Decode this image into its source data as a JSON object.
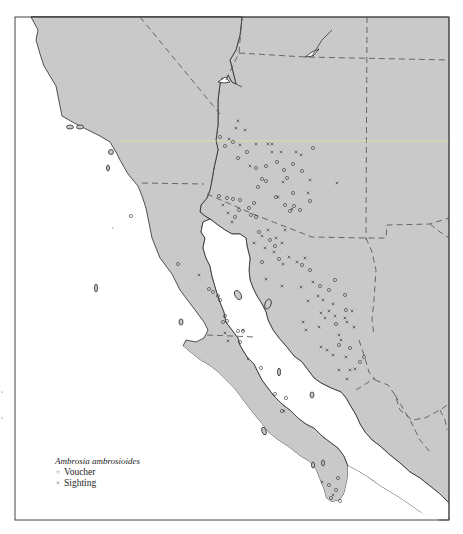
{
  "map": {
    "type": "species-distribution-map",
    "region": "Southwestern United States and Northwestern Mexico",
    "colors": {
      "land": "#c9c9c9",
      "water": "#ffffff",
      "coast": "#2a2a2a",
      "border": "#5a5a5a",
      "marker": "#333333"
    }
  },
  "legend": {
    "title": "Ambrosia ambrosioides",
    "items": [
      {
        "symbol": "circle",
        "glyph": "○",
        "label": "Voucher"
      },
      {
        "symbol": "cross",
        "glyph": "×",
        "label": "Sighting"
      }
    ]
  },
  "points": {
    "vouchers": [
      [
        131,
        216
      ],
      [
        178,
        264
      ],
      [
        220,
        137
      ],
      [
        225,
        146
      ],
      [
        233,
        142
      ],
      [
        238,
        158
      ],
      [
        247,
        152
      ],
      [
        256,
        168
      ],
      [
        266,
        166
      ],
      [
        277,
        162
      ],
      [
        284,
        170
      ],
      [
        293,
        164
      ],
      [
        302,
        171
      ],
      [
        287,
        178
      ],
      [
        262,
        179
      ],
      [
        258,
        187
      ],
      [
        313,
        148
      ],
      [
        266,
        181
      ],
      [
        219,
        196
      ],
      [
        227,
        198
      ],
      [
        233,
        199
      ],
      [
        240,
        200
      ],
      [
        249,
        208
      ],
      [
        254,
        203
      ],
      [
        235,
        217
      ],
      [
        251,
        215
      ],
      [
        285,
        205
      ],
      [
        290,
        211
      ],
      [
        294,
        206
      ],
      [
        300,
        210
      ],
      [
        310,
        201
      ],
      [
        239,
        210
      ],
      [
        256,
        217
      ],
      [
        293,
        193
      ],
      [
        276,
        197
      ],
      [
        259,
        232
      ],
      [
        270,
        240
      ],
      [
        275,
        246
      ],
      [
        279,
        259
      ],
      [
        262,
        262
      ],
      [
        302,
        265
      ],
      [
        310,
        270
      ],
      [
        320,
        286
      ],
      [
        329,
        290
      ],
      [
        335,
        280
      ],
      [
        345,
        295
      ],
      [
        336,
        324
      ],
      [
        346,
        310
      ],
      [
        339,
        345
      ],
      [
        350,
        348
      ],
      [
        360,
        362
      ],
      [
        364,
        357
      ],
      [
        209,
        289
      ],
      [
        213,
        292
      ],
      [
        218,
        296
      ],
      [
        220,
        300
      ],
      [
        225,
        316
      ],
      [
        223,
        322
      ],
      [
        238,
        331
      ],
      [
        243,
        331
      ],
      [
        240,
        342
      ],
      [
        227,
        321
      ],
      [
        261,
        368
      ],
      [
        275,
        394
      ],
      [
        286,
        398
      ],
      [
        282,
        411
      ],
      [
        329,
        485
      ],
      [
        336,
        490
      ],
      [
        338,
        478
      ],
      [
        331,
        498
      ],
      [
        340,
        501
      ]
    ],
    "sightings": [
      [
        238,
        121
      ],
      [
        236,
        128
      ],
      [
        245,
        130
      ],
      [
        229,
        139
      ],
      [
        240,
        145
      ],
      [
        256,
        144
      ],
      [
        268,
        144
      ],
      [
        272,
        144
      ],
      [
        272,
        152
      ],
      [
        281,
        152
      ],
      [
        296,
        152
      ],
      [
        301,
        155
      ],
      [
        250,
        166
      ],
      [
        283,
        182
      ],
      [
        310,
        180
      ],
      [
        337,
        183
      ],
      [
        308,
        193
      ],
      [
        278,
        197
      ],
      [
        292,
        209
      ],
      [
        223,
        205
      ],
      [
        228,
        213
      ],
      [
        232,
        222
      ],
      [
        262,
        236
      ],
      [
        268,
        230
      ],
      [
        276,
        238
      ],
      [
        285,
        230
      ],
      [
        254,
        243
      ],
      [
        265,
        248
      ],
      [
        274,
        252
      ],
      [
        282,
        243
      ],
      [
        289,
        257
      ],
      [
        305,
        258
      ],
      [
        297,
        262
      ],
      [
        266,
        279
      ],
      [
        283,
        264
      ],
      [
        282,
        286
      ],
      [
        301,
        287
      ],
      [
        313,
        282
      ],
      [
        318,
        296
      ],
      [
        323,
        300
      ],
      [
        308,
        301
      ],
      [
        321,
        313
      ],
      [
        325,
        318
      ],
      [
        329,
        311
      ],
      [
        333,
        304
      ],
      [
        335,
        316
      ],
      [
        345,
        318
      ],
      [
        352,
        311
      ],
      [
        347,
        322
      ],
      [
        354,
        327
      ],
      [
        339,
        335
      ],
      [
        341,
        340
      ],
      [
        306,
        330
      ],
      [
        319,
        327
      ],
      [
        303,
        322
      ],
      [
        321,
        347
      ],
      [
        339,
        370
      ],
      [
        346,
        357
      ],
      [
        333,
        355
      ],
      [
        350,
        370
      ],
      [
        327,
        350
      ],
      [
        225,
        333
      ],
      [
        228,
        341
      ],
      [
        199,
        275
      ],
      [
        248,
        359
      ],
      [
        284,
        411
      ],
      [
        322,
        482
      ],
      [
        333,
        495
      ],
      [
        243,
        330
      ],
      [
        347,
        379
      ],
      [
        355,
        369
      ]
    ],
    "stray_marks": [
      [
        113,
        228
      ],
      [
        2,
        392
      ],
      [
        2,
        418
      ]
    ]
  }
}
